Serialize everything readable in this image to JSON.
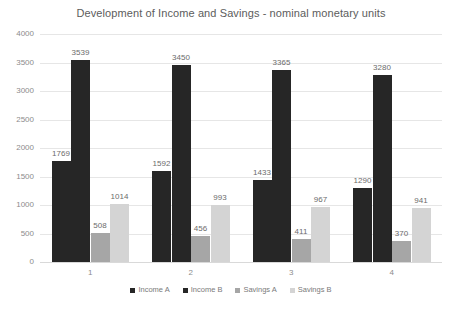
{
  "chart_data": {
    "type": "bar",
    "title": "Development of Income and Savings - nominal monetary units",
    "xlabel": "",
    "ylabel": "",
    "ylim": [
      0,
      4000
    ],
    "ytick_values": [
      0,
      500,
      1000,
      1500,
      2000,
      2500,
      3000,
      3500,
      4000
    ],
    "ytick_labels": [
      "0",
      "500",
      "1000",
      "1500",
      "2000",
      "2500",
      "3000",
      "3500",
      "4000"
    ],
    "categories": [
      "1",
      "2",
      "3",
      "4"
    ],
    "grid": true,
    "legend_position": "bottom",
    "data_labels": true,
    "series": [
      {
        "name": "Income A",
        "color": "#262626",
        "values": [
          1769,
          1592,
          1433,
          1290
        ],
        "labels": [
          "1769",
          "1592",
          "1433",
          "1290"
        ]
      },
      {
        "name": "Income B",
        "color": "#262626",
        "values": [
          3539,
          3450,
          3365,
          3280
        ],
        "labels": [
          "3539",
          "3450",
          "3365",
          "3280"
        ]
      },
      {
        "name": "Savings A",
        "color": "#a6a6a6",
        "values": [
          508,
          456,
          411,
          370
        ],
        "labels": [
          "508",
          "456",
          "411",
          "370"
        ]
      },
      {
        "name": "Savings B",
        "color": "#d4d4d4",
        "values": [
          1014,
          993,
          967,
          941
        ],
        "labels": [
          "1014",
          "993",
          "967",
          "941"
        ]
      }
    ]
  }
}
